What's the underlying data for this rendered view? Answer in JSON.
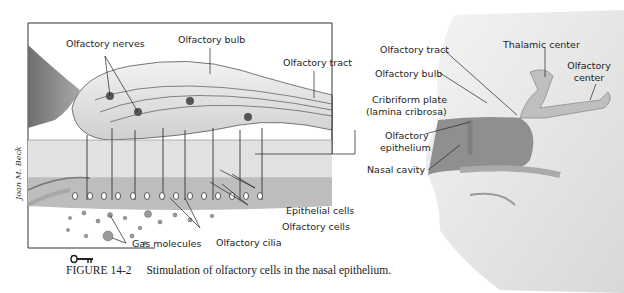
{
  "figure": {
    "number": "FIGURE 14-2",
    "caption": "Stimulation of olfactory cells in the nasal epithelium.",
    "artist_signature": "Joan M. Beck",
    "key_icon": "key-icon"
  },
  "left_panel": {
    "labels": {
      "olfactory_nerves": "Olfactory nerves",
      "olfactory_bulb": "Olfactory bulb",
      "olfactory_tract": "Olfactory tract",
      "epithelial_cells": "Epithelial cells",
      "olfactory_cells": "Olfactory cells",
      "olfactory_cilia": "Olfactory cilia",
      "gas_molecules": "Gas molecules"
    }
  },
  "right_panel": {
    "labels": {
      "olfactory_tract": "Olfactory tract",
      "olfactory_bulb": "Olfactory bulb",
      "cribriform_plate": "Cribriform plate",
      "lamina_cribrosa": "(lamina cribrosa)",
      "olfactory_epithelium_1": "Olfactory",
      "olfactory_epithelium_2": "epithelium",
      "nasal_cavity": "Nasal cavity",
      "thalamic_center": "Thalamic center",
      "olfactory_center_1": "Olfactory",
      "olfactory_center_2": "center"
    }
  },
  "colors": {
    "ink": "#1e1e1e",
    "tissue_dark": "#8a8a8a",
    "tissue_mid": "#b8b8b8",
    "tissue_light": "#dcdcdc",
    "background": "#ffffff"
  }
}
